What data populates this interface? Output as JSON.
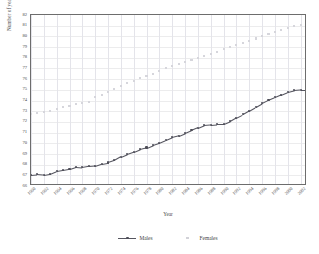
{
  "chart_data": {
    "type": "line",
    "title": "",
    "xlabel": "Year",
    "ylabel": "Number of years",
    "ylim": [
      66,
      82
    ],
    "ytick_step": 1,
    "yticks": [
      82,
      81,
      80,
      79,
      78,
      77,
      76,
      75,
      74,
      73,
      72,
      71,
      70,
      69,
      68,
      67,
      66
    ],
    "xlim": [
      1960,
      2003
    ],
    "xtick_labels": [
      "1960",
      "1962",
      "1964",
      "1966",
      "1968",
      "1970",
      "1972",
      "1974",
      "1976",
      "1978",
      "1980",
      "1982",
      "1984",
      "1986",
      "1988",
      "1990",
      "1992",
      "1994",
      "1996",
      "1998",
      "2000",
      "2002"
    ],
    "x": [
      1960,
      1961,
      1962,
      1963,
      1964,
      1965,
      1966,
      1967,
      1968,
      1969,
      1970,
      1971,
      1972,
      1973,
      1974,
      1975,
      1976,
      1977,
      1978,
      1979,
      1980,
      1981,
      1982,
      1983,
      1984,
      1985,
      1986,
      1987,
      1988,
      1989,
      1990,
      1991,
      1992,
      1993,
      1994,
      1995,
      1996,
      1997,
      1998,
      1999,
      2000,
      2001,
      2002,
      2003
    ],
    "grid": true,
    "legend_position": "bottom",
    "series": [
      {
        "name": "Males",
        "marker": "diamond",
        "color": "#4d4d57",
        "values": [
          67.05,
          67.1,
          67.05,
          67.15,
          67.4,
          67.5,
          67.6,
          67.8,
          67.75,
          67.85,
          67.9,
          68.1,
          68.2,
          68.4,
          68.75,
          69.0,
          69.2,
          69.45,
          69.6,
          69.85,
          70.05,
          70.3,
          70.55,
          70.7,
          70.95,
          71.2,
          71.45,
          71.7,
          71.75,
          71.8,
          71.8,
          72.05,
          72.4,
          72.7,
          73.05,
          73.4,
          73.75,
          74.05,
          74.3,
          74.55,
          74.8,
          74.95,
          75.0,
          75.0
        ]
      },
      {
        "name": "Females",
        "marker": "square",
        "color": "#d6d6dc",
        "values": [
          72.7,
          72.85,
          72.9,
          73.0,
          73.2,
          73.35,
          73.5,
          73.7,
          73.8,
          73.9,
          74.3,
          74.55,
          74.8,
          75.05,
          75.35,
          75.6,
          75.85,
          76.1,
          76.3,
          76.5,
          76.75,
          77.0,
          77.25,
          77.4,
          77.6,
          77.8,
          78.0,
          78.2,
          78.35,
          78.5,
          78.8,
          79.0,
          79.2,
          79.4,
          79.6,
          79.8,
          80.0,
          80.2,
          80.4,
          80.6,
          80.8,
          80.95,
          81.05,
          81.1
        ]
      }
    ]
  },
  "legend": {
    "males_label": "Males",
    "females_label": "Females"
  },
  "axes": {
    "x_title": "Year",
    "y_title": "Number of years"
  }
}
